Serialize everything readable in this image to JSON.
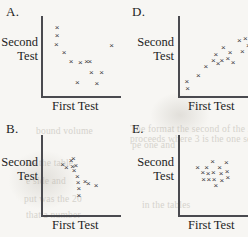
{
  "page": {
    "width": 248,
    "height": 237,
    "background": "#f7f6f3",
    "ink_color": "#1d1d1d",
    "axis_color": "#4a4a4f",
    "marker_color": "#3b3b40",
    "marker_glyph": "×"
  },
  "bleed_through_text": [
    {
      "text": "bound volume",
      "x": 36,
      "y": 126,
      "size": 9.5
    },
    {
      "text": "pe one and",
      "x": 132,
      "y": 140,
      "size": 9.5
    },
    {
      "text": "as the table",
      "x": 28,
      "y": 158,
      "size": 9.5
    },
    {
      "text": "e side and",
      "x": 26,
      "y": 176,
      "size": 9.5
    },
    {
      "text": "put was the 20",
      "x": 24,
      "y": 194,
      "size": 9.5
    },
    {
      "text": "that a number",
      "x": 26,
      "y": 210,
      "size": 9.5
    },
    {
      "text": "The format the second of the 25",
      "x": 130,
      "y": 124,
      "size": 9.5
    },
    {
      "text": "proceeds where 3 is the one section",
      "x": 130,
      "y": 134,
      "size": 9.5
    },
    {
      "text": "in the tables",
      "x": 142,
      "y": 200,
      "size": 9.5
    },
    {
      "text": "or some number",
      "x": 138,
      "y": 214,
      "size": 9.5
    }
  ],
  "panels": [
    {
      "id": "A",
      "letter": "A.",
      "ylabel_line1": "Second",
      "ylabel_line2": "Test",
      "xlabel": "First Test",
      "chart_data": {
        "type": "scatter",
        "title": "A.",
        "xlabel": "First Test",
        "ylabel": "Second Test",
        "xlim": [
          0,
          100
        ],
        "ylim": [
          0,
          100
        ],
        "grid": false,
        "legend": false,
        "correlation": "strong negative with one high outlier",
        "points": [
          {
            "x": 18,
            "y": 86
          },
          {
            "x": 18,
            "y": 76
          },
          {
            "x": 17,
            "y": 64
          },
          {
            "x": 27,
            "y": 54
          },
          {
            "x": 36,
            "y": 43
          },
          {
            "x": 48,
            "y": 42
          },
          {
            "x": 56,
            "y": 43
          },
          {
            "x": 60,
            "y": 43
          },
          {
            "x": 62,
            "y": 30
          },
          {
            "x": 75,
            "y": 29
          },
          {
            "x": 44,
            "y": 17
          },
          {
            "x": 69,
            "y": 16
          },
          {
            "x": 88,
            "y": 63
          }
        ]
      }
    },
    {
      "id": "D",
      "letter": "D.",
      "ylabel_line1": "Second",
      "ylabel_line2": "Test",
      "xlabel": "First Test",
      "chart_data": {
        "type": "scatter",
        "title": "D.",
        "xlabel": "First Test",
        "ylabel": "Second Test",
        "xlim": [
          0,
          100
        ],
        "ylim": [
          0,
          100
        ],
        "grid": false,
        "legend": false,
        "correlation": "positive",
        "points": [
          {
            "x": 9,
            "y": 18
          },
          {
            "x": 10,
            "y": 10
          },
          {
            "x": 24,
            "y": 26
          },
          {
            "x": 34,
            "y": 37
          },
          {
            "x": 44,
            "y": 45
          },
          {
            "x": 47,
            "y": 52
          },
          {
            "x": 50,
            "y": 41
          },
          {
            "x": 55,
            "y": 44
          },
          {
            "x": 57,
            "y": 61
          },
          {
            "x": 63,
            "y": 47
          },
          {
            "x": 66,
            "y": 55
          },
          {
            "x": 70,
            "y": 42
          },
          {
            "x": 78,
            "y": 70
          },
          {
            "x": 82,
            "y": 56
          },
          {
            "x": 86,
            "y": 72
          },
          {
            "x": 90,
            "y": 63
          }
        ]
      }
    },
    {
      "id": "B",
      "letter": "B.",
      "ylabel_line1": "Second",
      "ylabel_line2": "Test",
      "xlabel": "First Test",
      "chart_data": {
        "type": "scatter",
        "title": "B.",
        "xlabel": "First Test",
        "ylabel": "Second Test",
        "xlim": [
          0,
          100
        ],
        "ylim": [
          0,
          100
        ],
        "grid": false,
        "legend": false,
        "correlation": "steep negative, tight cluster",
        "points": [
          {
            "x": 25,
            "y": 63
          },
          {
            "x": 30,
            "y": 60
          },
          {
            "x": 36,
            "y": 68
          },
          {
            "x": 38,
            "y": 61
          },
          {
            "x": 39,
            "y": 71
          },
          {
            "x": 40,
            "y": 56
          },
          {
            "x": 42,
            "y": 62
          },
          {
            "x": 44,
            "y": 48
          },
          {
            "x": 45,
            "y": 41
          },
          {
            "x": 46,
            "y": 33
          },
          {
            "x": 46,
            "y": 25
          },
          {
            "x": 54,
            "y": 42
          },
          {
            "x": 58,
            "y": 40
          },
          {
            "x": 68,
            "y": 37
          }
        ]
      }
    },
    {
      "id": "E",
      "letter": "E.",
      "ylabel_line1": "Second",
      "ylabel_line2": "Test",
      "xlabel": "First Test",
      "chart_data": {
        "type": "scatter",
        "title": "E.",
        "xlabel": "First Test",
        "ylabel": "Second Test",
        "xlim": [
          0,
          100
        ],
        "ylim": [
          0,
          100
        ],
        "grid": false,
        "legend": false,
        "correlation": "none, horizontal band",
        "points": [
          {
            "x": 23,
            "y": 60
          },
          {
            "x": 30,
            "y": 53
          },
          {
            "x": 31,
            "y": 45
          },
          {
            "x": 35,
            "y": 60
          },
          {
            "x": 37,
            "y": 52
          },
          {
            "x": 38,
            "y": 44
          },
          {
            "x": 43,
            "y": 67
          },
          {
            "x": 44,
            "y": 53
          },
          {
            "x": 45,
            "y": 45
          },
          {
            "x": 47,
            "y": 37
          },
          {
            "x": 52,
            "y": 60
          },
          {
            "x": 54,
            "y": 52
          },
          {
            "x": 55,
            "y": 43
          },
          {
            "x": 61,
            "y": 66
          },
          {
            "x": 62,
            "y": 55
          },
          {
            "x": 63,
            "y": 47
          }
        ]
      }
    }
  ]
}
